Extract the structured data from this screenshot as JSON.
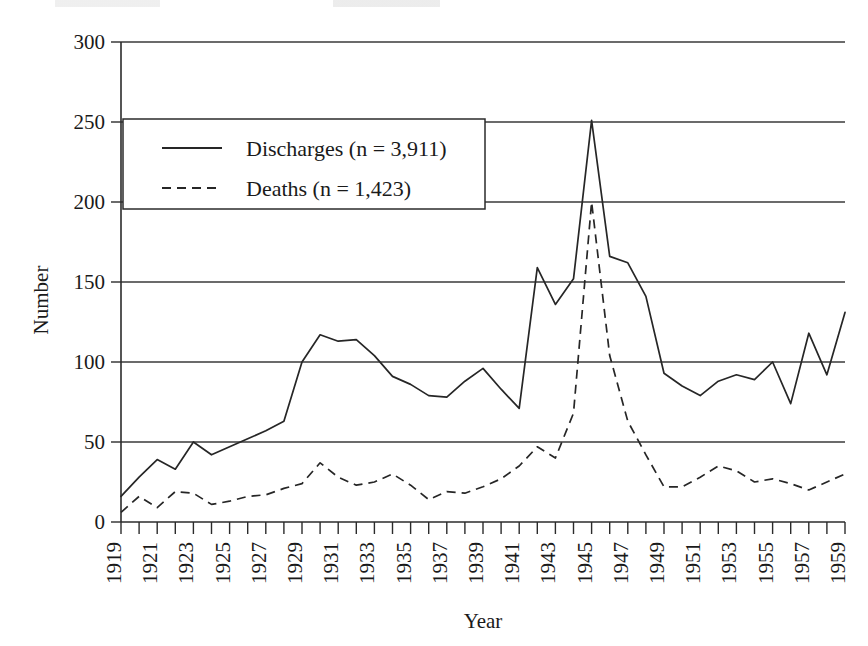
{
  "chart_data": {
    "type": "line",
    "title": "",
    "xlabel": "Year",
    "ylabel": "Number",
    "xlim": [
      1919,
      1959
    ],
    "ylim": [
      0,
      300
    ],
    "ytick_step": 50,
    "yticks": [
      0,
      50,
      100,
      150,
      200,
      250,
      300
    ],
    "xtick_labels": [
      "1919",
      "1921",
      "1923",
      "1925",
      "1927",
      "1929",
      "1931",
      "1933",
      "1935",
      "1937",
      "1939",
      "1941",
      "1943",
      "1945",
      "1947",
      "1949",
      "1951",
      "1953",
      "1955",
      "1957",
      "1959"
    ],
    "xtick_label_interval": 2,
    "xtick_label_rotation": -90,
    "grid": "horizontal",
    "legend_position": "upper-left-inside",
    "x": [
      1919,
      1920,
      1921,
      1922,
      1923,
      1924,
      1925,
      1926,
      1927,
      1928,
      1929,
      1930,
      1931,
      1932,
      1933,
      1934,
      1935,
      1936,
      1937,
      1938,
      1939,
      1940,
      1941,
      1942,
      1943,
      1944,
      1945,
      1946,
      1947,
      1948,
      1949,
      1950,
      1951,
      1952,
      1953,
      1954,
      1955,
      1956,
      1957,
      1958,
      1959
    ],
    "series": [
      {
        "name": "Discharges",
        "legend_label": "Discharges (n = 3,911)",
        "line_style": "solid",
        "n": 3911,
        "n_label": "3,911",
        "values": [
          16,
          28,
          39,
          33,
          50,
          42,
          47,
          52,
          57,
          63,
          100,
          117,
          113,
          114,
          104,
          91,
          86,
          79,
          78,
          88,
          96,
          83,
          71,
          159,
          136,
          152,
          251,
          166,
          162,
          141,
          93,
          85,
          79,
          88,
          92,
          89,
          100,
          74,
          118,
          92,
          131
        ]
      },
      {
        "name": "Deaths",
        "legend_label": "Deaths (n = 1,423)",
        "line_style": "dashed",
        "n": 1423,
        "n_label": "1,423",
        "values": [
          6,
          16,
          9,
          19,
          18,
          11,
          13,
          16,
          17,
          21,
          24,
          37,
          28,
          23,
          25,
          30,
          23,
          14,
          19,
          18,
          22,
          27,
          35,
          47,
          40,
          68,
          200,
          104,
          63,
          42,
          22,
          22,
          28,
          35,
          32,
          25,
          27,
          24,
          20,
          25,
          30
        ]
      }
    ]
  },
  "axes": {
    "x_title": "Year",
    "y_title": "Number"
  }
}
